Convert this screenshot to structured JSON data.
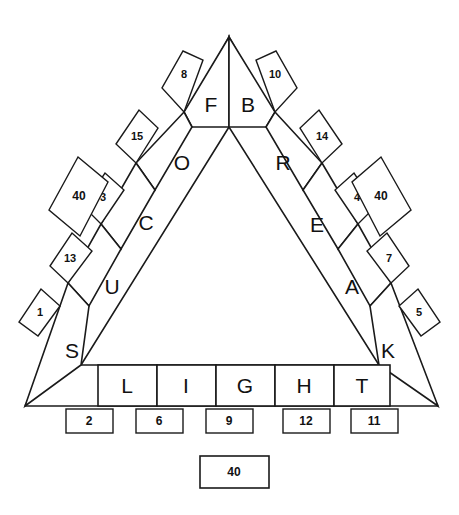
{
  "figure": {
    "background_color": "#ffffff",
    "stroke_color": "#1a1a1a",
    "text_color": "#111111"
  },
  "triangle": {
    "apex": {
      "x": 229,
      "y": 37
    },
    "bottom_left": {
      "x": 25,
      "y": 406
    },
    "bottom_right": {
      "x": 438,
      "y": 406
    }
  },
  "bottom_row": {
    "label": "LIGHT",
    "cells": [
      {
        "letter": "L",
        "number": "2"
      },
      {
        "letter": "I",
        "number": "6"
      },
      {
        "letter": "G",
        "number": "9"
      },
      {
        "letter": "H",
        "number": "12"
      },
      {
        "letter": "T",
        "number": "11"
      }
    ]
  },
  "left_edge": {
    "label": "SUCOF",
    "cells": [
      {
        "letter": "S",
        "number": "1"
      },
      {
        "letter": "U",
        "number": "13"
      },
      {
        "letter": "C",
        "number": "3"
      },
      {
        "letter": "O",
        "number": "15"
      },
      {
        "letter": "F",
        "number": "8"
      }
    ]
  },
  "right_edge": {
    "label": "BREAK",
    "cells": [
      {
        "letter": "B",
        "number": "10"
      },
      {
        "letter": "R",
        "number": "14"
      },
      {
        "letter": "E",
        "number": "4"
      },
      {
        "letter": "A",
        "number": "7"
      },
      {
        "letter": "K",
        "number": "5"
      }
    ]
  },
  "totals": {
    "left": "40",
    "right": "40",
    "bottom": "40"
  }
}
